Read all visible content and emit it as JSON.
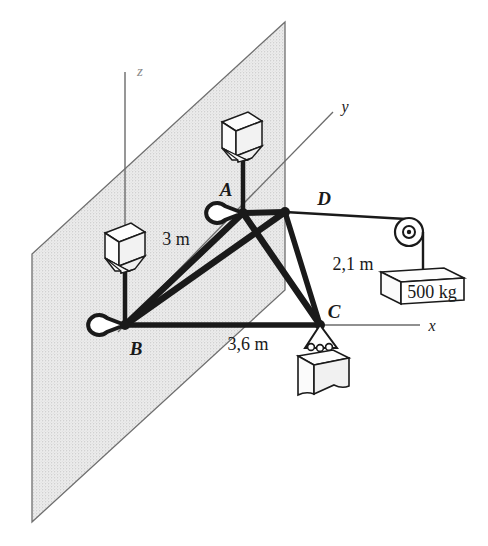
{
  "figure": {
    "kind": "engineering-statics-diagram",
    "background_color": "#ffffff",
    "ink_color": "#1a1a1a",
    "plane_fill_color": "#e3e3e3",
    "plane_edge_color": "#6b6b6b"
  },
  "axes": [
    {
      "name": "z-axis",
      "label": "z",
      "orientation": "vertical",
      "faint": true
    },
    {
      "name": "y-axis",
      "label": "y",
      "orientation": "diagonal-up-right"
    },
    {
      "name": "x-axis",
      "label": "x",
      "orientation": "horizontal-right"
    }
  ],
  "joints": [
    {
      "id": "A",
      "label": "A",
      "x": 243,
      "y": 213,
      "has_eyebolt": true
    },
    {
      "id": "B",
      "label": "B",
      "x": 125,
      "y": 325,
      "has_eyebolt": true
    },
    {
      "id": "C",
      "label": "C",
      "x": 320,
      "y": 325,
      "has_eyebolt": false
    },
    {
      "id": "D",
      "label": "D",
      "x": 285,
      "y": 212,
      "has_eyebolt": false
    }
  ],
  "dimensions": [
    {
      "name": "dimension-ab",
      "label": "3 m",
      "between": "A-B"
    },
    {
      "name": "dimension-dc",
      "label": "2,1 m",
      "between": "D-C"
    },
    {
      "name": "dimension-bc",
      "label": "3,6 m",
      "between": "B-C"
    }
  ],
  "loads": [
    {
      "name": "pulley-weight",
      "label": "500 kg",
      "shape": "box",
      "via": "pulley-from-D"
    },
    {
      "name": "hanging-block-c",
      "label": "",
      "shape": "block",
      "via": "hook-at-C"
    }
  ],
  "hoppers": [
    {
      "name": "hopper-above-a",
      "anchors_to": "A"
    },
    {
      "name": "hopper-above-b",
      "anchors_to": "B"
    }
  ],
  "members": [
    {
      "name": "member-ab",
      "from": "A",
      "to": "B"
    },
    {
      "name": "member-ac",
      "from": "A",
      "to": "C"
    },
    {
      "name": "member-ad",
      "from": "A",
      "to": "D"
    },
    {
      "name": "member-bd",
      "from": "B",
      "to": "D"
    },
    {
      "name": "member-bc",
      "from": "B",
      "to": "C"
    },
    {
      "name": "member-dc",
      "from": "D",
      "to": "C"
    }
  ]
}
